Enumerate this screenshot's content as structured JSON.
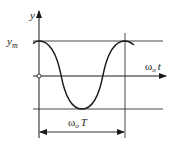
{
  "diagram": {
    "type": "cosine waveform",
    "labels": {
      "y_axis": "y",
      "amplitude": "y",
      "amplitude_sub": "m",
      "x_axis_omega": "ω",
      "x_axis_sub": "o",
      "x_axis_var": "t",
      "period_omega": "ω",
      "period_sub": "o",
      "period_var": "T"
    },
    "colors": {
      "line": "#1a1a1a",
      "background": "#ffffff"
    }
  }
}
